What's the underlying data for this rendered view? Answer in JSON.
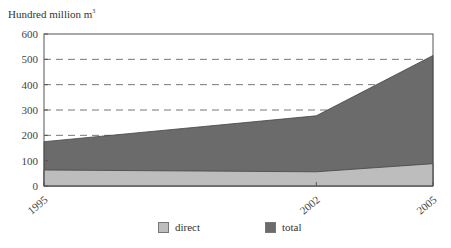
{
  "chart_data": {
    "type": "area",
    "stacked": false,
    "title": "",
    "ylabel": "Hundred million m³",
    "ylabel_main": "Hundred million m",
    "ylabel_sup": "3",
    "xlabel": "",
    "x": [
      "1995",
      "2002",
      "2005"
    ],
    "series": [
      {
        "name": "total",
        "values": [
          175,
          277,
          515
        ],
        "color": "#6b6b6b"
      },
      {
        "name": "direct",
        "values": [
          63,
          56,
          88
        ],
        "color": "#bdbdbd"
      }
    ],
    "ylim": [
      0,
      600
    ],
    "yticks": [
      0,
      100,
      200,
      300,
      400,
      500,
      600
    ],
    "gridlines": {
      "style": "dashed",
      "values": [
        200,
        300,
        400,
        500
      ]
    },
    "legend": {
      "position": "bottom",
      "entries": [
        "direct",
        "total"
      ]
    }
  },
  "legend": {
    "items": [
      {
        "label": "direct",
        "color": "#bdbdbd"
      },
      {
        "label": "total",
        "color": "#6b6b6b"
      }
    ]
  }
}
